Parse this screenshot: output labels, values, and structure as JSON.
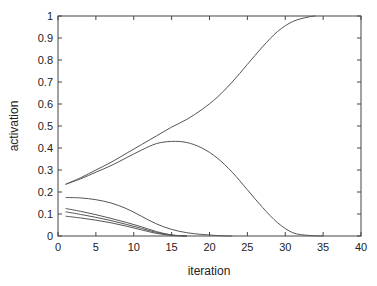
{
  "chart_data": {
    "type": "line",
    "title": "",
    "xlabel": "iteration",
    "ylabel": "activation",
    "xlim": [
      0,
      40
    ],
    "ylim": [
      0,
      1
    ],
    "xticks": [
      0,
      5,
      10,
      15,
      20,
      25,
      30,
      35,
      40
    ],
    "yticks": [
      0,
      0.1,
      0.2,
      0.3,
      0.4,
      0.5,
      0.6,
      0.7,
      0.8,
      0.9,
      1
    ],
    "xtick_labels": [
      "0",
      "5",
      "10",
      "15",
      "20",
      "25",
      "30",
      "35",
      "40"
    ],
    "ytick_labels": [
      "0",
      "0.1",
      "0.2",
      "0.3",
      "0.4",
      "0.5",
      "0.6",
      "0.7",
      "0.8",
      "0.9",
      "1"
    ],
    "grid": false,
    "legend": null,
    "line_color": "#555555",
    "series": [
      {
        "name": "unit 1 (rises to 1)",
        "x": [
          1,
          3,
          5,
          7,
          9,
          11,
          13,
          15,
          17,
          19,
          21,
          23,
          25,
          27,
          29,
          31,
          33,
          34
        ],
        "y": [
          0.235,
          0.265,
          0.3,
          0.335,
          0.375,
          0.415,
          0.455,
          0.495,
          0.53,
          0.575,
          0.63,
          0.7,
          0.78,
          0.86,
          0.93,
          0.975,
          0.995,
          1.0
        ]
      },
      {
        "name": "unit 2 (peaks then falls)",
        "x": [
          1,
          3,
          5,
          7,
          9,
          11,
          13,
          15,
          17,
          19,
          21,
          23,
          25,
          27,
          29,
          31,
          33,
          35
        ],
        "y": [
          0.235,
          0.26,
          0.29,
          0.32,
          0.355,
          0.39,
          0.42,
          0.43,
          0.425,
          0.4,
          0.355,
          0.29,
          0.21,
          0.13,
          0.06,
          0.015,
          0.003,
          0.0
        ]
      },
      {
        "name": "unit 3",
        "x": [
          1,
          3,
          5,
          7,
          9,
          11,
          13,
          15,
          17,
          19,
          21,
          23
        ],
        "y": [
          0.175,
          0.173,
          0.165,
          0.15,
          0.125,
          0.09,
          0.055,
          0.03,
          0.015,
          0.007,
          0.002,
          0.0
        ]
      },
      {
        "name": "unit 4",
        "x": [
          1,
          3,
          5,
          7,
          9,
          11,
          13,
          15,
          17
        ],
        "y": [
          0.125,
          0.112,
          0.097,
          0.08,
          0.062,
          0.042,
          0.02,
          0.005,
          0.0
        ]
      },
      {
        "name": "unit 5",
        "x": [
          1,
          3,
          5,
          7,
          9,
          11,
          13,
          15,
          17
        ],
        "y": [
          0.11,
          0.098,
          0.085,
          0.07,
          0.053,
          0.035,
          0.016,
          0.004,
          0.0
        ]
      },
      {
        "name": "unit 6",
        "x": [
          1,
          3,
          5,
          7,
          9,
          11,
          13,
          15,
          17
        ],
        "y": [
          0.09,
          0.082,
          0.072,
          0.06,
          0.045,
          0.028,
          0.012,
          0.003,
          0.0
        ]
      }
    ]
  }
}
